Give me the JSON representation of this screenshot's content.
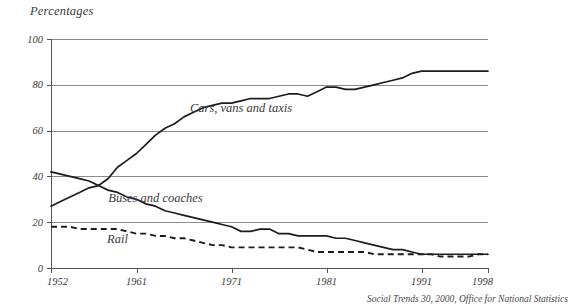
{
  "chart_data": {
    "type": "line",
    "title": "Percentages",
    "ylabel": "Percentages",
    "xlabel": "",
    "ylim": [
      0,
      100
    ],
    "xlim": [
      1952,
      1998
    ],
    "grid": true,
    "legend_position": "inline-annotations",
    "source": "Social Trends 30, 2000, Office for National Statistics",
    "ytick_labels": [
      "0",
      "20",
      "40",
      "60",
      "80",
      "100"
    ],
    "ytick_values": [
      0,
      20,
      40,
      60,
      80,
      100
    ],
    "xtick_labels": [
      "1952",
      "1961",
      "1971",
      "1981",
      "1991",
      "1998"
    ],
    "xtick_values": [
      1952,
      1961,
      1971,
      1981,
      1991,
      1998
    ],
    "x": [
      1952,
      1953,
      1954,
      1955,
      1956,
      1957,
      1958,
      1959,
      1960,
      1961,
      1962,
      1963,
      1964,
      1965,
      1966,
      1967,
      1968,
      1969,
      1970,
      1971,
      1972,
      1973,
      1974,
      1975,
      1976,
      1977,
      1978,
      1979,
      1980,
      1981,
      1982,
      1983,
      1984,
      1985,
      1986,
      1987,
      1988,
      1989,
      1990,
      1991,
      1992,
      1993,
      1994,
      1995,
      1996,
      1997,
      1998
    ],
    "series": [
      {
        "name": "Cars, vans and taxis",
        "style": "solid",
        "color": "#1c1c1c",
        "values": [
          27,
          29,
          31,
          33,
          35,
          36,
          39,
          44,
          47,
          50,
          54,
          58,
          61,
          63,
          66,
          68,
          70,
          71,
          72,
          72,
          73,
          74,
          74,
          74,
          75,
          76,
          76,
          75,
          77,
          79,
          79,
          78,
          78,
          79,
          80,
          81,
          82,
          83,
          85,
          86,
          86,
          86,
          86,
          86,
          86,
          86,
          86
        ]
      },
      {
        "name": "Buses and coaches",
        "style": "solid",
        "color": "#1c1c1c",
        "values": [
          42,
          41,
          40,
          39,
          38,
          36,
          34,
          33,
          31,
          30,
          28,
          27,
          25,
          24,
          23,
          22,
          21,
          20,
          19,
          18,
          16,
          16,
          17,
          17,
          15,
          15,
          14,
          14,
          14,
          14,
          13,
          13,
          12,
          11,
          10,
          9,
          8,
          8,
          7,
          6,
          6,
          6,
          6,
          6,
          6,
          6,
          6
        ]
      },
      {
        "name": "Rail",
        "style": "dashed",
        "color": "#1c1c1c",
        "values": [
          18,
          18,
          18,
          17,
          17,
          17,
          17,
          17,
          16,
          15,
          15,
          14,
          14,
          13,
          13,
          12,
          11,
          10,
          10,
          9,
          9,
          9,
          9,
          9,
          9,
          9,
          9,
          8,
          7,
          7,
          7,
          7,
          7,
          7,
          6,
          6,
          6,
          6,
          6,
          6,
          6,
          5,
          5,
          5,
          5,
          6,
          6
        ]
      }
    ],
    "annotations": [
      {
        "text": "Cars, vans and taxis",
        "x": 1972,
        "y": 68
      },
      {
        "text": "Buses and coaches",
        "x": 1963,
        "y": 29
      },
      {
        "text": "Rail",
        "x": 1959,
        "y": 11
      }
    ]
  }
}
